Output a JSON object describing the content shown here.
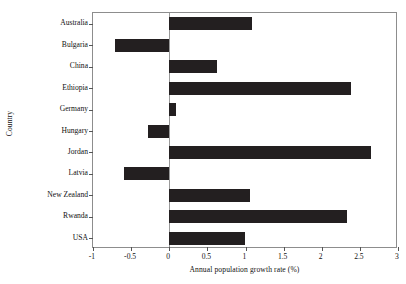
{
  "chart_data": {
    "type": "bar",
    "orientation": "horizontal",
    "title": "",
    "xlabel": "Annual population growth rate (%)",
    "ylabel": "Country",
    "categories": [
      "Australia",
      "Bulgaria",
      "China",
      "Ethiopia",
      "Germany",
      "Hungary",
      "Jordan",
      "Latvia",
      "New Zealand",
      "Rwanda",
      "USA"
    ],
    "values": [
      1.09,
      -0.71,
      0.62,
      2.39,
      0.09,
      -0.28,
      2.64,
      -0.6,
      1.06,
      2.33,
      0.99
    ],
    "xlim": [
      -1,
      3
    ],
    "xticks": [
      -1,
      -0.5,
      0,
      0.5,
      1,
      1.5,
      2,
      2.5,
      3
    ],
    "xtick_labels": [
      "-1",
      "-0.5",
      "0",
      "0.5",
      "1",
      "1.5",
      "2",
      "2.5",
      "3"
    ],
    "grid": false,
    "legend": null,
    "bar_color": "#231f20",
    "frame_color": "#8d8d8d",
    "background": "#ffffff"
  }
}
